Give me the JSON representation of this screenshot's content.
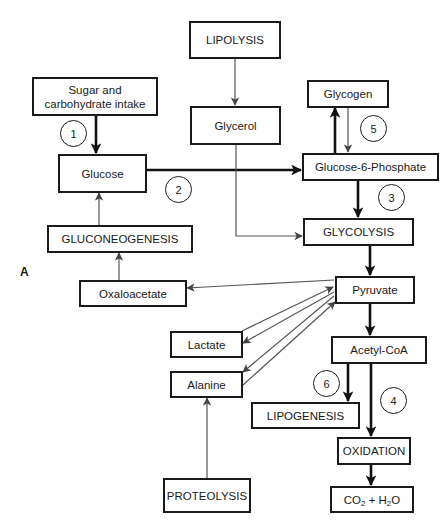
{
  "figure": {
    "panel_label": "A",
    "nodes": {
      "lipolysis": "LIPOLYSIS",
      "sugar_intake": "Sugar and carbohydrate intake",
      "glycerol": "Glycerol",
      "glycogen": "Glycogen",
      "glucose": "Glucose",
      "glucose_6_phosphate": "Glucose-6-Phosphate",
      "gluconeogenesis": "GLUCONEOGENESIS",
      "glycolysis": "GLYCOLYSIS",
      "oxaloacetate": "Oxaloacetate",
      "pyruvate": "Pyruvate",
      "lactate": "Lactate",
      "acetyl_coa": "Acetyl-CoA",
      "alanine": "Alanine",
      "lipogenesis": "LIPOGENESIS",
      "oxidation": "OXIDATION",
      "proteolysis": "PROTEOLYSIS",
      "co2_h2o": {
        "co": "CO",
        "sub1": "2",
        "plus_h": " + H",
        "sub2": "2",
        "o": "O"
      }
    },
    "step_markers": [
      "1",
      "2",
      "3",
      "4",
      "5",
      "6"
    ],
    "edges": [
      {
        "from": "Sugar and carbohydrate intake",
        "to": "Glucose",
        "weight": "thick",
        "step": "1"
      },
      {
        "from": "Glucose",
        "to": "Glucose-6-Phosphate",
        "weight": "thick",
        "step": "2"
      },
      {
        "from": "Glucose-6-Phosphate",
        "to": "GLYCOLYSIS",
        "weight": "thick",
        "step": "3"
      },
      {
        "from": "Glucose-6-Phosphate",
        "to": "Glycogen",
        "weight": "thick"
      },
      {
        "from": "Glycogen",
        "to": "Glucose-6-Phosphate",
        "weight": "thin",
        "step": "5"
      },
      {
        "from": "LIPOLYSIS",
        "to": "Glycerol",
        "weight": "thin"
      },
      {
        "from": "Glycerol",
        "to": "GLYCOLYSIS",
        "weight": "thin"
      },
      {
        "from": "GLUCONEOGENESIS",
        "to": "Glucose",
        "weight": "thin"
      },
      {
        "from": "Oxaloacetate",
        "to": "GLUCONEOGENESIS",
        "weight": "thin"
      },
      {
        "from": "Pyruvate",
        "to": "Oxaloacetate",
        "weight": "thin"
      },
      {
        "from": "GLYCOLYSIS",
        "to": "Pyruvate",
        "weight": "thick"
      },
      {
        "from": "Lactate",
        "to": "Pyruvate",
        "weight": "thin"
      },
      {
        "from": "Pyruvate",
        "to": "Lactate",
        "weight": "thin"
      },
      {
        "from": "Pyruvate",
        "to": "Alanine",
        "weight": "thin"
      },
      {
        "from": "Alanine",
        "to": "Pyruvate",
        "weight": "thin"
      },
      {
        "from": "PROTEOLYSIS",
        "to": "Alanine",
        "weight": "thin"
      },
      {
        "from": "Pyruvate",
        "to": "Acetyl-CoA",
        "weight": "thick"
      },
      {
        "from": "Acetyl-CoA",
        "to": "LIPOGENESIS",
        "weight": "thick",
        "step": "6"
      },
      {
        "from": "Acetyl-CoA",
        "to": "OXIDATION",
        "weight": "thick",
        "step": "4"
      },
      {
        "from": "OXIDATION",
        "to": "CO2 + H2O",
        "weight": "thick"
      }
    ]
  }
}
